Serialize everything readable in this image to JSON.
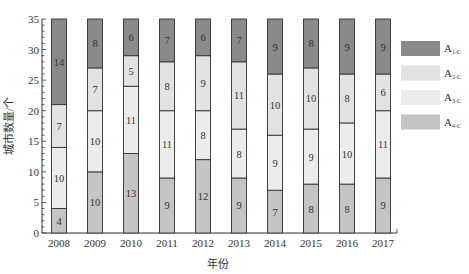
{
  "chart_data": {
    "type": "bar",
    "stacked": true,
    "title": "",
    "xlabel": "年份",
    "ylabel": "城市数量/个",
    "ylim": [
      0,
      35
    ],
    "yticks": [
      0,
      5,
      10,
      15,
      20,
      25,
      30,
      35
    ],
    "grid": false,
    "legend_position": "right",
    "categories": [
      "2008",
      "2009",
      "2010",
      "2011",
      "2012",
      "2013",
      "2014",
      "2015",
      "2016",
      "2017"
    ],
    "series": [
      {
        "name": "A4-C",
        "label_main": "A",
        "label_sub": "4-C",
        "color": "#c4c4c4",
        "values": [
          4,
          10,
          13,
          9,
          12,
          9,
          7,
          8,
          8,
          9
        ]
      },
      {
        "name": "A3-C",
        "label_main": "A",
        "label_sub": "3-C",
        "color": "#ececec",
        "values": [
          10,
          10,
          11,
          11,
          8,
          8,
          9,
          9,
          10,
          11
        ]
      },
      {
        "name": "A2-C",
        "label_main": "A",
        "label_sub": "2-C",
        "color": "#e2e2e2",
        "values": [
          7,
          7,
          5,
          8,
          9,
          11,
          10,
          10,
          8,
          6
        ]
      },
      {
        "name": "A1-C",
        "label_main": "A",
        "label_sub": "1-C",
        "color": "#8a8a8a",
        "values": [
          14,
          8,
          6,
          7,
          6,
          7,
          9,
          8,
          9,
          9
        ]
      }
    ],
    "legend_order": [
      "A1-C",
      "A2-C",
      "A3-C",
      "A4-C"
    ]
  }
}
